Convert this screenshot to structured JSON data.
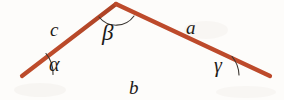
{
  "figure": {
    "kind": "geometry-diagram",
    "shape": "triangle",
    "background_color": "#fdfcfa",
    "stroke": {
      "color": "#b8462a",
      "highlight_color": "#d9694a",
      "shadow_color": "#8e3018",
      "width_px": 4
    },
    "arc": {
      "color": "#3a3530",
      "width_px": 1
    },
    "text_color": "#1d1a17",
    "vertices": [
      {
        "name": "A",
        "x": 22,
        "y": 76
      },
      {
        "name": "B",
        "x": 116,
        "y": 4
      },
      {
        "name": "C",
        "x": 270,
        "y": 76
      }
    ],
    "sides": [
      {
        "id": "a",
        "label": "a",
        "between": [
          "B",
          "C"
        ],
        "position": "upper-right"
      },
      {
        "id": "b",
        "label": "b",
        "between": [
          "A",
          "C"
        ],
        "position": "bottom"
      },
      {
        "id": "c",
        "label": "c",
        "between": [
          "A",
          "B"
        ],
        "position": "upper-left"
      }
    ],
    "angles": [
      {
        "id": "alpha",
        "label": "α",
        "at_vertex": "A",
        "position": "bottom-left"
      },
      {
        "id": "beta",
        "label": "β",
        "at_vertex": "B",
        "position": "apex"
      },
      {
        "id": "gamma",
        "label": "γ",
        "at_vertex": "C",
        "position": "bottom-right"
      }
    ]
  }
}
